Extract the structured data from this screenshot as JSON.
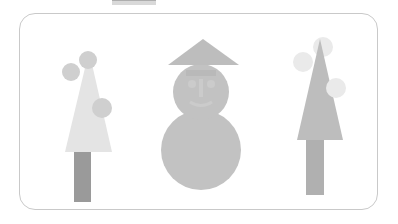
{
  "canvas": {
    "background_color": "#ffffff",
    "card": {
      "border_color": "#c9c9c9",
      "fill_color": "#ffffff",
      "corner_radius": 16,
      "x": 19,
      "y": 13,
      "width": 359,
      "height": 197
    },
    "top_bar": {
      "fill_color": "#d9d9d9",
      "edge_color": "#aeaeae",
      "x": 112,
      "y": 0,
      "width": 44,
      "height": 5
    }
  },
  "palette": {
    "tree_light": "#e4e4e4",
    "tree_medium": "#bdbdbd",
    "trunk_dark": "#9a9a9a",
    "trunk_medium": "#b0b0b0",
    "ornament_light": "#eaeaea",
    "ornament_medium": "#cfcfcf",
    "snow_body": "#c2c2c2",
    "hat_grey": "#bdbdbd",
    "face_light": "#d6d6d6"
  },
  "figures": [
    {
      "id": "left-tree",
      "name": "Left Tree",
      "type": "tree",
      "foliage_color": "#e4e4e4",
      "trunk_color": "#9a9a9a",
      "foliage": {
        "apex_x": 89,
        "apex_y": 51,
        "left_x": 65,
        "right_x": 112,
        "base_y": 152
      },
      "trunk": {
        "x": 74,
        "y": 152,
        "width": 17,
        "height": 50
      },
      "ornaments": [
        {
          "cx": 88,
          "cy": 60,
          "r": 9,
          "color": "#cfcfcf"
        },
        {
          "cx": 71,
          "cy": 72,
          "r": 9,
          "color": "#cfcfcf"
        },
        {
          "cx": 102,
          "cy": 108,
          "r": 10,
          "color": "#cfcfcf"
        }
      ]
    },
    {
      "id": "center-snowman",
      "name": "Center Snowman",
      "type": "snowman",
      "body_color": "#c2c2c2",
      "hat_color": "#bdbdbd",
      "hat": {
        "apex_x": 203,
        "apex_y": 39,
        "left_x": 168,
        "right_x": 239,
        "base_y": 65
      },
      "head": {
        "cx": 201,
        "cy": 92,
        "r": 28
      },
      "body": {
        "cx": 201,
        "cy": 150,
        "r": 40
      },
      "hat_band": {
        "x": 186,
        "y": 70,
        "width": 30,
        "height": 6,
        "color": "#b0b0b0"
      },
      "face_color": "#d6d6d6"
    },
    {
      "id": "right-tree",
      "name": "Right Tree",
      "type": "tree",
      "foliage_color": "#bdbdbd",
      "trunk_color": "#b0b0b0",
      "foliage": {
        "apex_x": 320,
        "apex_y": 39,
        "left_x": 297,
        "right_x": 343,
        "base_y": 140
      },
      "trunk": {
        "x": 306,
        "y": 140,
        "width": 18,
        "height": 55
      },
      "ornaments": [
        {
          "cx": 323,
          "cy": 47,
          "r": 10,
          "color": "#eaeaea"
        },
        {
          "cx": 303,
          "cy": 62,
          "r": 10,
          "color": "#eaeaea"
        },
        {
          "cx": 336,
          "cy": 88,
          "r": 10,
          "color": "#eaeaea"
        }
      ]
    }
  ],
  "accessibility": {
    "canvas_label": "Shape illustration canvas",
    "left_tree_label": "Left Tree",
    "center_snowman_label": "Center Snowman",
    "right_tree_label": "Right Tree",
    "top_bar_label": "Canvas handle"
  }
}
